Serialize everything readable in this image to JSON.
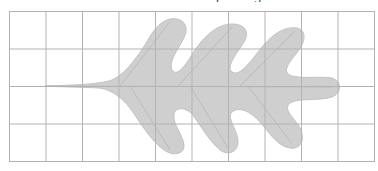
{
  "figure": {
    "caption_clipped": "leaf traced on a square grid",
    "grid": {
      "columns": 10,
      "rows": 4,
      "left": 9,
      "top": 11,
      "cell_size": 36.5,
      "line_color": "#b3b3b3"
    },
    "leaf": {
      "fill_color": "#cfcfcf",
      "outline_color": "#c2c2c2",
      "vein_color": "#b8b8b8",
      "description": "oak leaf with stem pointing left, three lobes on top and three on bottom"
    }
  }
}
